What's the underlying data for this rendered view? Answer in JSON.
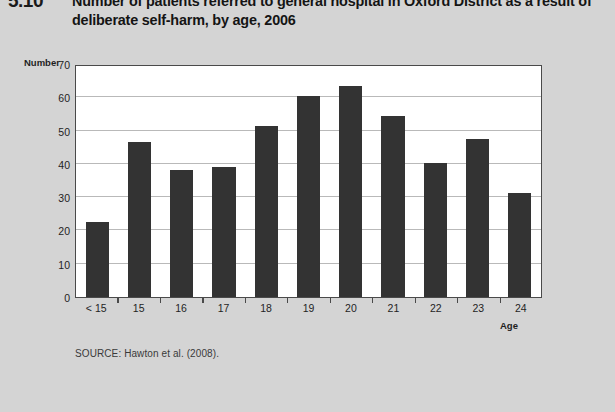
{
  "figure": {
    "number": "5.10",
    "title": "Number of patients referred to general hospital in Oxford District as a result of deliberate self-harm, by age, 2006",
    "source_note": "SOURCE: Hawton et al. (2008)."
  },
  "colors": {
    "page_background": "#d4d4d4",
    "plot_background": "#ffffff",
    "bar_fill": "#333333",
    "gridline": "#b9b9b9",
    "axis_line": "#4a4a4a",
    "text": "#1f1f1f"
  },
  "chart_data": {
    "type": "bar",
    "title": "Number of patients referred to general hospital in Oxford District as a result of deliberate self-harm, by age, 2006",
    "xlabel": "Age",
    "ylabel": "Number",
    "categories": [
      "< 15",
      "15",
      "16",
      "17",
      "18",
      "19",
      "20",
      "21",
      "22",
      "23",
      "24"
    ],
    "values": [
      22.5,
      46.5,
      38.3,
      39.2,
      51.3,
      60.5,
      63.5,
      54.5,
      40.3,
      47.5,
      31.3
    ],
    "ylim": [
      0,
      70
    ],
    "yticks": [
      0,
      10,
      20,
      30,
      40,
      50,
      60,
      70
    ],
    "ytick_labels": [
      "0",
      "10",
      "20",
      "30",
      "40",
      "50",
      "60",
      "70"
    ],
    "grid": true,
    "legend": false,
    "legend_position": "none"
  }
}
